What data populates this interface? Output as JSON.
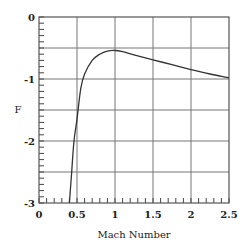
{
  "chart_data": {
    "type": "line",
    "title": "",
    "xlabel": "Mach Number",
    "ylabel": "F",
    "xlim": [
      0,
      2.5
    ],
    "ylim": [
      -3,
      0
    ],
    "x_ticks": [
      "0",
      "0.5",
      "1",
      "1.5",
      "2",
      "2.5"
    ],
    "y_ticks": [
      "0",
      "-1",
      "-2",
      "-3"
    ],
    "grid": true,
    "legend": null,
    "series": [
      {
        "name": "F",
        "x": [
          0.4,
          0.43,
          0.46,
          0.5,
          0.55,
          0.6,
          0.7,
          0.8,
          0.9,
          1.0,
          1.1,
          1.25,
          1.5,
          1.75,
          2.0,
          2.25,
          2.5
        ],
        "y": [
          -3.0,
          -2.5,
          -2.0,
          -1.65,
          -1.15,
          -0.92,
          -0.7,
          -0.6,
          -0.55,
          -0.54,
          -0.56,
          -0.61,
          -0.69,
          -0.77,
          -0.85,
          -0.92,
          -0.98
        ]
      }
    ]
  }
}
